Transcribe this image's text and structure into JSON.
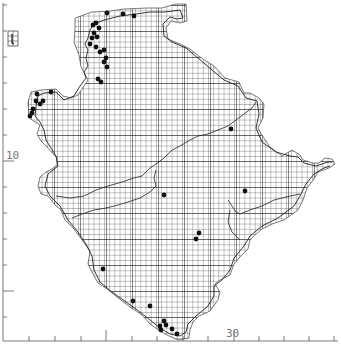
{
  "map": {
    "type": "tetrad-distribution-map",
    "colors": {
      "background": "#ffffff",
      "grid": "#333333",
      "grid_major": "#111111",
      "coast": "#222222",
      "river": "#222222",
      "record": "#111111",
      "axis": "#555555",
      "label": "#777777"
    },
    "axes": {
      "left_label": "10",
      "bottom_label": "30",
      "left_ticks_y": [
        5,
        31,
        57,
        83,
        109,
        135,
        161,
        187,
        213,
        239,
        265,
        291,
        317
      ],
      "left_major_ticks_y": [
        161,
        291
      ],
      "bottom_ticks_x": [
        29,
        55,
        81,
        106,
        132,
        157,
        183,
        208,
        234,
        259,
        284,
        309,
        334
      ],
      "bottom_major_ticks_x": [
        106,
        234
      ]
    },
    "grid": {
      "cell_px": 5.2,
      "major_every": 5
    },
    "inset": {
      "name": "Lundy",
      "x": 8,
      "y": 31,
      "w": 10,
      "h": 15
    },
    "records": [
      [
        107,
        13
      ],
      [
        123,
        14
      ],
      [
        134,
        16
      ],
      [
        96,
        23
      ],
      [
        93,
        25
      ],
      [
        99,
        28
      ],
      [
        94,
        33
      ],
      [
        92,
        38
      ],
      [
        97,
        37
      ],
      [
        90,
        44
      ],
      [
        96,
        47
      ],
      [
        100,
        52
      ],
      [
        104,
        50
      ],
      [
        106,
        58
      ],
      [
        104,
        62
      ],
      [
        107,
        67
      ],
      [
        98,
        79
      ],
      [
        101,
        82
      ],
      [
        51,
        92
      ],
      [
        37,
        94
      ],
      [
        36,
        101
      ],
      [
        40,
        104
      ],
      [
        43,
        101
      ],
      [
        33,
        109
      ],
      [
        32,
        113
      ],
      [
        30,
        116
      ],
      [
        231,
        129
      ],
      [
        164,
        195
      ],
      [
        245,
        191
      ],
      [
        199,
        233
      ],
      [
        196,
        239
      ],
      [
        103,
        269
      ],
      [
        133,
        301
      ],
      [
        150,
        306
      ],
      [
        164,
        321
      ],
      [
        160,
        326
      ],
      [
        166,
        325
      ],
      [
        172,
        329
      ],
      [
        177,
        334
      ],
      [
        161,
        330
      ]
    ]
  }
}
